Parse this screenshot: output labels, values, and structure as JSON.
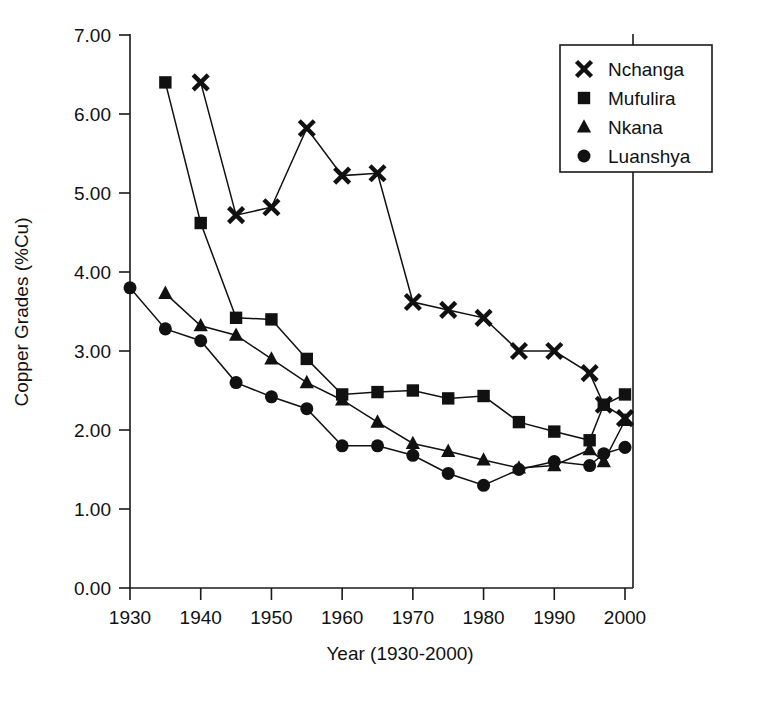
{
  "chart_data": {
    "type": "line",
    "title": "",
    "xlabel": "Year (1930-2000)",
    "ylabel": "Copper Grades (%Cu)",
    "xlim": [
      1930,
      2000
    ],
    "ylim": [
      0.0,
      7.0
    ],
    "xticks": [
      1930,
      1940,
      1950,
      1960,
      1970,
      1980,
      1990,
      2000
    ],
    "xtick_labels": [
      "1930",
      "1940",
      "1950",
      "1960",
      "1970",
      "1980",
      "1990",
      "2000"
    ],
    "yticks": [
      0.0,
      1.0,
      2.0,
      3.0,
      4.0,
      5.0,
      6.0,
      7.0
    ],
    "ytick_labels": [
      "0.00",
      "1.00",
      "2.00",
      "3.00",
      "4.00",
      "5.00",
      "6.00",
      "7.00"
    ],
    "grid": false,
    "legend_position": "top-right",
    "series": [
      {
        "name": "Nchanga",
        "marker": "x",
        "x": [
          1940,
          1945,
          1950,
          1955,
          1960,
          1965,
          1970,
          1975,
          1980,
          1985,
          1990,
          1995,
          1997,
          2000
        ],
        "values": [
          6.4,
          4.72,
          4.82,
          5.82,
          5.22,
          5.25,
          3.62,
          3.52,
          3.42,
          3.0,
          3.0,
          2.72,
          2.32,
          2.15
        ]
      },
      {
        "name": "Mufulira",
        "marker": "square",
        "x": [
          1935,
          1940,
          1945,
          1950,
          1955,
          1960,
          1965,
          1970,
          1975,
          1980,
          1985,
          1990,
          1995,
          1997,
          2000
        ],
        "values": [
          6.4,
          4.62,
          3.42,
          3.4,
          2.9,
          2.45,
          2.48,
          2.5,
          2.4,
          2.43,
          2.1,
          1.98,
          1.87,
          2.32,
          2.45
        ]
      },
      {
        "name": "Nkana",
        "marker": "triangle",
        "x": [
          1935,
          1940,
          1945,
          1950,
          1955,
          1960,
          1965,
          1970,
          1975,
          1980,
          1985,
          1990,
          1995,
          1997,
          2000
        ],
        "values": [
          3.73,
          3.32,
          3.2,
          2.9,
          2.6,
          2.38,
          2.1,
          1.83,
          1.73,
          1.62,
          1.52,
          1.55,
          1.75,
          1.6,
          2.12
        ]
      },
      {
        "name": "Luanshya",
        "marker": "circle",
        "x": [
          1930,
          1935,
          1940,
          1945,
          1950,
          1955,
          1960,
          1965,
          1970,
          1975,
          1980,
          1985,
          1990,
          1995,
          1997,
          2000
        ],
        "values": [
          3.8,
          3.28,
          3.13,
          2.6,
          2.42,
          2.27,
          1.8,
          1.8,
          1.68,
          1.45,
          1.3,
          1.5,
          1.6,
          1.55,
          1.7,
          1.78
        ]
      }
    ]
  },
  "legend": {
    "entries": [
      {
        "label": "Nchanga",
        "marker": "x"
      },
      {
        "label": "Mufulira",
        "marker": "square"
      },
      {
        "label": "Nkana",
        "marker": "triangle"
      },
      {
        "label": "Luanshya",
        "marker": "circle"
      }
    ]
  },
  "caption": {
    "text": ""
  }
}
